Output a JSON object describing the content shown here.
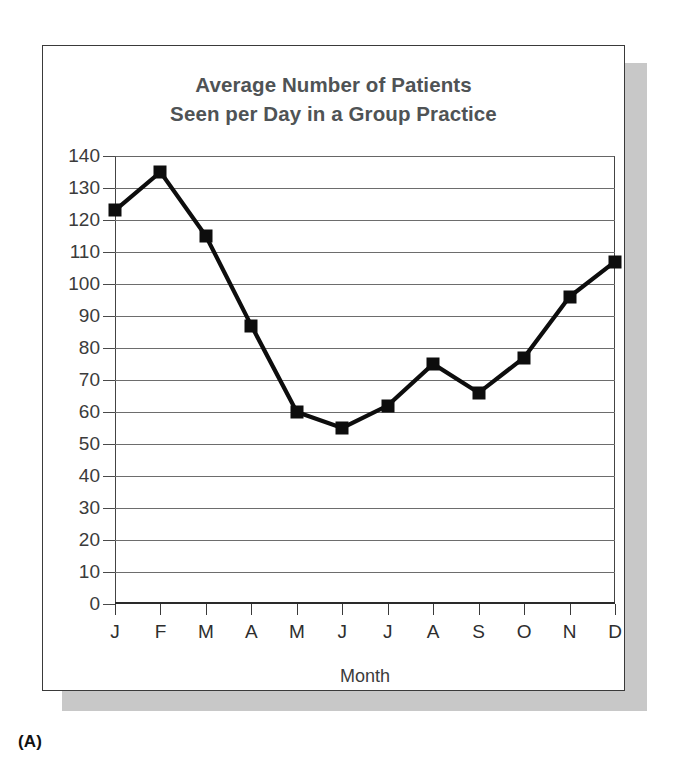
{
  "figure": {
    "panel_caption": "(A)"
  },
  "chart_data": {
    "type": "line",
    "title": "Average Number of Patients\nSeen per Day in a Group Practice",
    "title_line1": "Average Number of Patients",
    "title_line2": "Seen per Day in a Group Practice",
    "xlabel": "Month",
    "ylabel": "",
    "categories": [
      "J",
      "F",
      "M",
      "A",
      "M",
      "J",
      "J",
      "A",
      "S",
      "O",
      "N",
      "D"
    ],
    "category_full_names": [
      "January",
      "February",
      "March",
      "April",
      "May",
      "June",
      "July",
      "August",
      "September",
      "October",
      "November",
      "December"
    ],
    "values": [
      123,
      135,
      115,
      87,
      60,
      55,
      62,
      75,
      66,
      77,
      96,
      107
    ],
    "ylim": [
      0,
      140
    ],
    "ytick_step": 10,
    "yticks": [
      0,
      10,
      20,
      30,
      40,
      50,
      60,
      70,
      80,
      90,
      100,
      110,
      120,
      130,
      140
    ],
    "ytick_labels": [
      "0",
      "10",
      "20",
      "30",
      "40",
      "50",
      "60",
      "70",
      "80",
      "90",
      "100",
      "110",
      "120",
      "130",
      "140"
    ],
    "grid": "horizontal",
    "legend": "none",
    "marker": "square",
    "line_color": "#0d0d0d",
    "marker_color": "#0d0d0d",
    "gridline_color": "#6d6d6d",
    "title_color": "#4f5355",
    "background": "#ffffff"
  }
}
